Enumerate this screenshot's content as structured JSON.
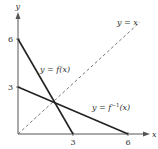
{
  "figure": {
    "axes": {
      "x_label": "x",
      "y_label": "y",
      "x_ticks": [
        "3",
        "6"
      ],
      "y_ticks": [
        "3",
        "6"
      ]
    },
    "curves": [
      {
        "name": "f",
        "label": "y = f(x)",
        "style": "solid",
        "points": [
          [
            0,
            6
          ],
          [
            3,
            0
          ]
        ]
      },
      {
        "name": "f_inverse",
        "label_prefix": "y = f",
        "label_sup": "−1",
        "label_suffix": "(x)",
        "style": "solid",
        "points": [
          [
            0,
            3
          ],
          [
            6,
            0
          ]
        ]
      },
      {
        "name": "identity",
        "label": "y = x",
        "style": "dashed",
        "points": [
          [
            0,
            0
          ],
          [
            6.7,
            7
          ]
        ]
      }
    ],
    "colors": {
      "axis": "#555555",
      "curve": "#222222",
      "dashed": "#666666",
      "text": "#333333"
    }
  }
}
